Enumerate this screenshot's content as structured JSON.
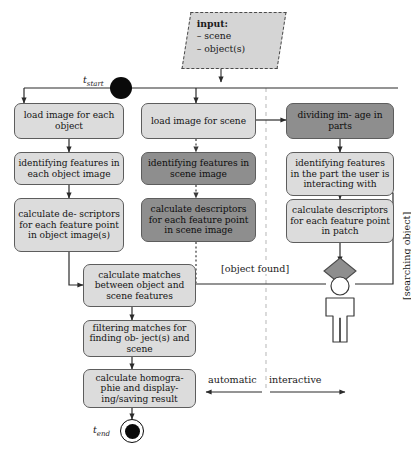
{
  "diagram": {
    "type": "uml-activity-diagram",
    "colors": {
      "box_light": "#dcdcdc",
      "box_dark": "#8e8e8e",
      "note_fill": "#d5d5d5",
      "diamond_fill": "#8e8e8e",
      "stroke": "#5d5d5d",
      "node_black": "#0a0a0a",
      "divider": "#b5b5b5"
    }
  },
  "note": {
    "title": "input:",
    "items": [
      "– scene",
      "– object(s)"
    ]
  },
  "start_node": {
    "label": "t",
    "sub": "start"
  },
  "end_node": {
    "label": "t",
    "sub": "end"
  },
  "branches": {
    "object": [
      {
        "id": "load-image-object",
        "text": "load image for each object",
        "shade": "light"
      },
      {
        "id": "identify-object-features",
        "text": "identifying features in each object image",
        "shade": "light"
      },
      {
        "id": "descriptors-object",
        "text": "calculate de- scriptors for each feature point in object image(s)",
        "shade": "light"
      }
    ],
    "scene": [
      {
        "id": "load-image-scene",
        "text": "load image for scene",
        "shade": "light"
      },
      {
        "id": "identify-scene-features",
        "text": "identifying features in scene image",
        "shade": "dark"
      },
      {
        "id": "descriptors-scene",
        "text": "calculate descriptors for each feature point in scene image",
        "shade": "dark"
      }
    ],
    "interactive": [
      {
        "id": "dividing-image",
        "text": "dividing im- age in parts",
        "shade": "dark"
      },
      {
        "id": "identify-patch-features",
        "text": "identifying features in the part the user is interacting with",
        "shade": "light"
      },
      {
        "id": "descriptors-patch",
        "text": "calculate descriptors for each feature point in patch",
        "shade": "light"
      }
    ],
    "merge": [
      {
        "id": "calculate-matches",
        "text": "calculate matches between object and scene features",
        "shade": "light"
      },
      {
        "id": "filtering-matches",
        "text": "filtering matches for finding ob- ject(s) and scene",
        "shade": "light"
      },
      {
        "id": "calculate-homography",
        "text": "calculate homogra- phie and display- ing/saving result",
        "shade": "light"
      }
    ]
  },
  "guards": {
    "object_found": "[object found]",
    "searching_object": "[searching object]"
  },
  "swimlanes": {
    "left": "automatic",
    "right": "interactive"
  }
}
